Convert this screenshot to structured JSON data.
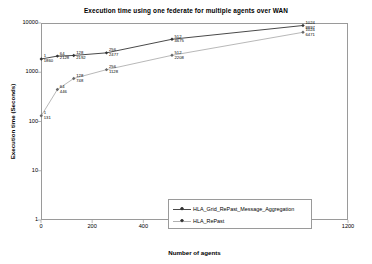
{
  "chart_data": {
    "type": "line",
    "title": "Execution time using one federate for multiple agents over WAN",
    "xlabel": "Number of agents",
    "ylabel": "Execution time (Seconds)",
    "xlim": [
      0,
      1200
    ],
    "ylim": [
      1,
      10000
    ],
    "yscale": "log",
    "grid": false,
    "legend_position": "bottom-right",
    "xticks": [
      "0",
      "200",
      "400",
      "600",
      "800",
      "1000",
      "1200"
    ],
    "xtick_values": [
      0,
      200,
      400,
      600,
      800,
      1000,
      1200
    ],
    "yticks": [
      "1",
      "10",
      "100",
      "1000",
      "10000"
    ],
    "ytick_values": [
      1,
      10,
      100,
      1000,
      10000
    ],
    "x": [
      1,
      64,
      128,
      256,
      512,
      1024
    ],
    "series": [
      {
        "name": "HLA_Grid_RePast_Message_Aggregation",
        "color": "#4a4a4a",
        "values": [
          1860,
          2128,
          2192,
          2477,
          4675,
          8897
        ],
        "point_labels": [
          {
            "n": "1",
            "v": "1860"
          },
          {
            "n": "64",
            "v": "2128"
          },
          {
            "n": "128",
            "v": "2192"
          },
          {
            "n": "256",
            "v": "2477"
          },
          {
            "n": "512",
            "v": "4675"
          },
          {
            "n": "1024",
            "v": "8897"
          }
        ]
      },
      {
        "name": "HLA_RePast",
        "color": "#b0b0b0",
        "values": [
          131,
          446,
          748,
          1128,
          2208,
          6471
        ],
        "point_labels": [
          {
            "n": "1",
            "v": "131"
          },
          {
            "n": "64",
            "v": "446"
          },
          {
            "n": "128",
            "v": "748"
          },
          {
            "n": "256",
            "v": "1128"
          },
          {
            "n": "512",
            "v": "2208"
          },
          {
            "n": "1024",
            "v": "6471"
          }
        ]
      }
    ]
  },
  "legend": {
    "items": [
      {
        "label": "HLA_Grid_RePast_Message_Aggregation"
      },
      {
        "label": "HLA_RePast"
      }
    ]
  }
}
